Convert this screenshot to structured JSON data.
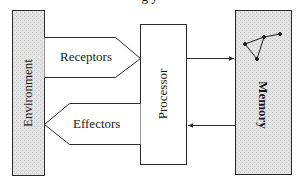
{
  "diagram": {
    "caption_partial": "g   y",
    "nodes": {
      "environment": {
        "label": "Environment",
        "fill": "#dcdcdc"
      },
      "receptors": {
        "label": "Receptors"
      },
      "effectors": {
        "label": "Effectors"
      },
      "processor": {
        "label": "Processor"
      },
      "memory": {
        "label": "Memory",
        "fill": "#dcdcdc"
      }
    },
    "edges": [
      {
        "from": "environment",
        "to": "processor",
        "via": "receptors"
      },
      {
        "from": "processor",
        "to": "environment",
        "via": "effectors"
      },
      {
        "from": "processor",
        "to": "memory"
      },
      {
        "from": "memory",
        "to": "processor"
      }
    ],
    "colors": {
      "stroke": "#2a2a2a",
      "shaded": "#dcdcdc",
      "background": "#ffffff"
    }
  }
}
